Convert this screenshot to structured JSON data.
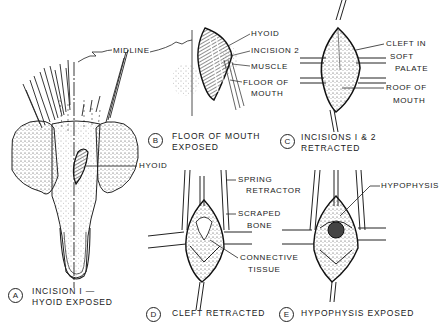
{
  "figure": {
    "panels": [
      {
        "letter": "A",
        "caption_line1": "INCISION I —",
        "caption_line2": "HYOID EXPOSED"
      },
      {
        "letter": "B",
        "caption_line1": "FLOOR OF MOUTH",
        "caption_line2": "EXPOSED"
      },
      {
        "letter": "C",
        "caption_line1": "INCISIONS I & 2",
        "caption_line2": "RETRACTED"
      },
      {
        "letter": "D",
        "caption_line1": "CLEFT RETRACTED"
      },
      {
        "letter": "E",
        "caption_line1": "HYPOPHYSIS EXPOSED"
      }
    ],
    "labels": {
      "midline": "MIDLINE",
      "hyoid_a": "HYOID",
      "hyoid_b": "HYOID",
      "incision2": "INCISION 2",
      "muscle": "MUSCLE",
      "floor_of_mouth_1": "FLOOR OF",
      "floor_of_mouth_2": "MOUTH",
      "cleft_1": "CLEFT IN",
      "cleft_2": "SOFT",
      "cleft_3": "PALATE",
      "roof_1": "ROOF OF",
      "roof_2": "MOUTH",
      "spring_1": "SPRING",
      "spring_2": "RETRACTOR",
      "scraped_1": "SCRAPED",
      "scraped_2": "BONE",
      "connective_1": "CONNECTIVE",
      "connective_2": "TISSUE",
      "hypophysis": "HYPOPHYSIS"
    }
  }
}
